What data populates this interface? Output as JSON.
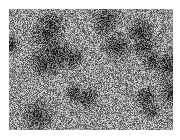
{
  "image": {
    "description": "Grayscale high-frequency noisy texture with mottled dark patches",
    "colors": {
      "background": "#ffffff",
      "light": "#c8c8c8",
      "mid": "#7a7a7a",
      "dark": "#1e1e1e"
    },
    "box": {
      "x": 9,
      "y": 9,
      "width": 164,
      "height": 121
    }
  }
}
